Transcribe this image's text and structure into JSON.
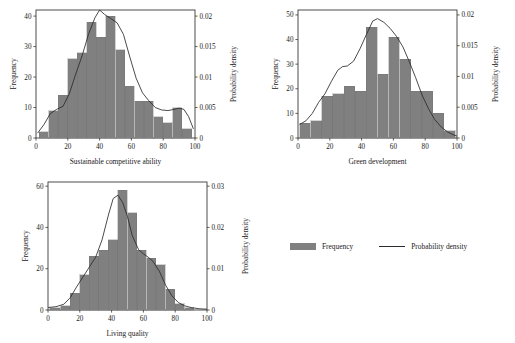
{
  "figure": {
    "background": "#ffffff",
    "bar_color": "#808080",
    "line_color": "#2b2b2b",
    "axis_color": "#3a3a3a"
  },
  "legend": {
    "position": "bottom-right",
    "frequency_label": "Frequency",
    "density_label": "Probability density",
    "swatch_name": "frequency-swatch",
    "line_name": "probability-density-line-sample"
  },
  "chart_data": [
    {
      "type": "bar",
      "id": "sustainable-competitive-ability",
      "title": "",
      "xlabel": "Sustainable competitive ability",
      "ylabel": "Frequency",
      "y2label": "Probability density",
      "xlim": [
        0,
        100
      ],
      "ylim": [
        0,
        42
      ],
      "y2lim": [
        0,
        0.021
      ],
      "grid": false,
      "xticks": [
        0,
        20,
        40,
        60,
        80,
        100
      ],
      "yticks": [
        0,
        10,
        20,
        30,
        40
      ],
      "y2ticks": [
        0,
        0.005,
        0.01,
        0.015,
        0.02
      ],
      "y2ticklabels": [
        "0",
        "0.005",
        "0.01",
        "0.015",
        "0.02"
      ],
      "bin_edges": [
        2,
        8,
        14,
        20,
        26,
        32,
        38,
        44,
        50,
        56,
        62,
        68,
        74,
        80,
        86,
        92,
        98
      ],
      "categories": [
        "2-8",
        "8-14",
        "14-20",
        "20-26",
        "26-32",
        "32-38",
        "38-44",
        "44-50",
        "50-56",
        "56-62",
        "62-68",
        "68-74",
        "74-80",
        "80-86",
        "86-92",
        "92-98"
      ],
      "values": [
        2,
        9,
        14,
        26,
        28,
        38,
        33,
        40,
        29,
        17,
        12,
        12,
        7,
        5,
        10,
        3
      ],
      "series": [
        {
          "name": "Frequency",
          "kind": "bar",
          "values": [
            2,
            9,
            14,
            26,
            28,
            38,
            33,
            40,
            29,
            17,
            12,
            12,
            7,
            5,
            10,
            3
          ]
        },
        {
          "name": "Probability density",
          "kind": "line",
          "x": [
            1,
            5,
            9,
            13,
            17,
            21,
            25,
            29,
            33,
            37,
            40,
            43,
            47,
            51,
            55,
            59,
            63,
            67,
            71,
            75,
            79,
            83,
            87,
            90,
            93,
            96,
            99
          ],
          "y": [
            0.0008,
            0.0022,
            0.004,
            0.0047,
            0.0052,
            0.0073,
            0.0105,
            0.0135,
            0.017,
            0.0197,
            0.021,
            0.0203,
            0.0196,
            0.0189,
            0.017,
            0.0133,
            0.0098,
            0.0074,
            0.0061,
            0.005,
            0.0046,
            0.0045,
            0.0047,
            0.0049,
            0.0047,
            0.0035,
            0.0015
          ]
        }
      ]
    },
    {
      "type": "bar",
      "id": "green-development",
      "title": "",
      "xlabel": "Green development",
      "ylabel": "Frequency",
      "y2label": "Probability density",
      "xlim": [
        0,
        100
      ],
      "ylim": [
        0,
        52
      ],
      "y2lim": [
        0,
        0.0208
      ],
      "grid": false,
      "xticks": [
        0,
        20,
        40,
        60,
        80,
        100
      ],
      "yticks": [
        0,
        10,
        20,
        30,
        40,
        50
      ],
      "y2ticks": [
        0,
        0.005,
        0.01,
        0.015,
        0.02
      ],
      "y2ticklabels": [
        "0",
        "0.005",
        "0.01",
        "0.015",
        "0.02"
      ],
      "bin_edges": [
        1,
        8,
        15,
        22,
        29,
        36,
        43,
        50,
        57,
        64,
        71,
        78,
        85,
        92,
        99
      ],
      "categories": [
        "1-8",
        "8-15",
        "15-22",
        "22-29",
        "29-36",
        "36-43",
        "43-50",
        "50-57",
        "57-64",
        "64-71",
        "71-78",
        "78-85",
        "85-92",
        "92-99"
      ],
      "values": [
        6,
        7,
        17,
        18,
        21,
        19,
        45,
        26,
        41,
        32,
        19,
        19,
        10,
        3
      ],
      "series": [
        {
          "name": "Frequency",
          "kind": "bar",
          "values": [
            6,
            7,
            17,
            18,
            21,
            19,
            45,
            26,
            41,
            32,
            19,
            19,
            10,
            3
          ]
        },
        {
          "name": "Probability density",
          "kind": "line",
          "x": [
            1,
            5,
            9,
            13,
            17,
            21,
            25,
            28,
            31,
            35,
            39,
            43,
            47,
            50,
            54,
            58,
            62,
            66,
            70,
            74,
            78,
            82,
            86,
            90,
            94,
            97,
            100
          ],
          "y": [
            0.0022,
            0.0028,
            0.004,
            0.0058,
            0.0072,
            0.0092,
            0.011,
            0.0116,
            0.0117,
            0.0125,
            0.0145,
            0.0168,
            0.019,
            0.0194,
            0.0188,
            0.0178,
            0.0165,
            0.0148,
            0.0124,
            0.0098,
            0.007,
            0.0048,
            0.003,
            0.0018,
            0.001,
            0.0006,
            0.0003
          ]
        }
      ]
    },
    {
      "type": "bar",
      "id": "living-quality",
      "title": "",
      "xlabel": "Living quality",
      "ylabel": "Frequency",
      "y2label": "Probability density",
      "xlim": [
        0,
        100
      ],
      "ylim": [
        0,
        62
      ],
      "y2lim": [
        0,
        0.031
      ],
      "grid": false,
      "xticks": [
        0,
        20,
        40,
        60,
        80,
        100
      ],
      "yticks": [
        0,
        20,
        40,
        60
      ],
      "y2ticks": [
        0,
        0.01,
        0.02,
        0.03
      ],
      "y2ticklabels": [
        "0",
        "0.01",
        "0.02",
        "0.03"
      ],
      "bin_edges": [
        1,
        8,
        14,
        20,
        26,
        32,
        38,
        44,
        50,
        56,
        62,
        68,
        74,
        80,
        86,
        92
      ],
      "categories": [
        "1-8",
        "8-14",
        "14-20",
        "20-26",
        "26-32",
        "32-38",
        "38-44",
        "44-50",
        "50-56",
        "56-62",
        "62-68",
        "68-74",
        "74-80",
        "80-86",
        "86-92"
      ],
      "values": [
        1,
        2,
        8,
        17,
        26,
        29,
        34,
        58,
        47,
        29,
        25,
        22,
        10,
        3,
        1
      ],
      "series": [
        {
          "name": "Frequency",
          "kind": "bar",
          "values": [
            1,
            2,
            8,
            17,
            26,
            29,
            34,
            58,
            47,
            29,
            25,
            22,
            10,
            3,
            1
          ]
        },
        {
          "name": "Probability density",
          "kind": "line",
          "x": [
            0,
            5,
            10,
            14,
            18,
            22,
            26,
            30,
            34,
            38,
            41,
            44,
            47,
            50,
            53,
            57,
            60,
            63,
            66,
            70,
            74,
            78,
            82,
            86,
            90,
            95,
            100
          ],
          "y": [
            0.0006,
            0.0008,
            0.0014,
            0.003,
            0.0056,
            0.008,
            0.0104,
            0.0128,
            0.017,
            0.023,
            0.027,
            0.0278,
            0.026,
            0.0226,
            0.018,
            0.0146,
            0.0136,
            0.0128,
            0.0118,
            0.0094,
            0.006,
            0.0034,
            0.0018,
            0.001,
            0.0006,
            0.0003,
            0.0002
          ]
        }
      ]
    }
  ]
}
